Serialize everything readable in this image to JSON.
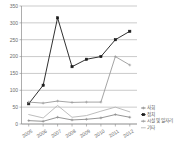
{
  "chart_data": {
    "type": "line",
    "title": "",
    "xlabel": "",
    "ylabel": "",
    "categories": [
      "2005",
      "2006",
      "2007",
      "2008",
      "2009",
      "2010",
      "2011",
      "2012"
    ],
    "ylim": [
      0,
      350
    ],
    "yticks": [
      0,
      50,
      100,
      150,
      200,
      250,
      300,
      350
    ],
    "ytick_labels": [
      "0",
      "50",
      "100",
      "150",
      "200",
      "250",
      "300",
      "350"
    ],
    "grid": true,
    "legend_position": "right",
    "series": [
      {
        "name": "사회",
        "color": "#8a8a8a",
        "marker": "cross",
        "values": [
          10,
          8,
          20,
          12,
          14,
          18,
          28,
          20
        ]
      },
      {
        "name": "정치",
        "color": "#1a1a1a",
        "marker": "square",
        "values": [
          60,
          115,
          315,
          170,
          192,
          200,
          250,
          275
        ]
      },
      {
        "name": "시설 및 일자리",
        "color": "#9a9a9a",
        "marker": "cross",
        "values": [
          65,
          62,
          68,
          64,
          65,
          65,
          200,
          175
        ]
      },
      {
        "name": "기타",
        "color": "#b5b5b5",
        "marker": "none",
        "values": [
          28,
          18,
          55,
          20,
          25,
          38,
          50,
          36
        ]
      }
    ]
  },
  "legend": {
    "items": [
      {
        "label": "사회"
      },
      {
        "label": "정치"
      },
      {
        "label": "시설 및 일자리"
      },
      {
        "label": "기타"
      }
    ]
  }
}
